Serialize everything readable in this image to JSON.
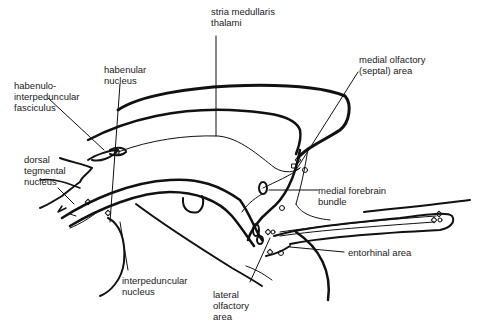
{
  "diagram": {
    "labels": {
      "stria_medullaris": "stria medullaris\nthalami",
      "habenular_nucleus": "habenular\nnucleus",
      "habenulo_interpeduncular": "habenulo-\ninterpeduncular\nfasciculus",
      "dorsal_tegmental": "dorsal\ntegmental\nnucleus",
      "medial_olfactory": "medial olfactory\n(septal) area",
      "medial_forebrain_bundle": "medial forebrain\nbundle",
      "entorhinal_area": "entorhinal area",
      "interpeduncular_nucleus": "interpeduncular\nnucleus",
      "lateral_olfactory": "lateral\nolfactory\narea"
    },
    "line_color": "#111111"
  }
}
